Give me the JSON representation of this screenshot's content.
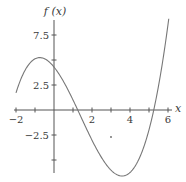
{
  "chart_data": {
    "type": "line",
    "title": "",
    "xlabel": "x",
    "ylabel": "f (x)",
    "xlim": [
      -2,
      6.2
    ],
    "ylim": [
      -6.5,
      8.5
    ],
    "grid": false,
    "x_ticks": [
      -2,
      -1,
      0,
      1,
      2,
      3,
      4,
      5,
      6
    ],
    "x_tick_labels": [
      {
        "value": -2,
        "label": "−2"
      },
      {
        "value": 2,
        "label": "2"
      },
      {
        "value": 4,
        "label": "4"
      },
      {
        "value": 6,
        "label": "6"
      }
    ],
    "y_ticks": [
      -5,
      -2.5,
      2.5,
      5,
      7.5
    ],
    "y_tick_labels": [
      {
        "value": 7.5,
        "label": "7.5"
      },
      {
        "value": 2.5,
        "label": "2.5"
      },
      {
        "value": -2.5,
        "label": "−2.5"
      }
    ],
    "series": [
      {
        "name": "f(x)",
        "description": "cubic curve with local max near x=-0.8 and local min near x=3.7",
        "x": [
          -2,
          -1.5,
          -1,
          -0.75,
          -0.5,
          0,
          0.5,
          1,
          1.25,
          1.5,
          2,
          2.5,
          3,
          3.5,
          3.7,
          4,
          4.5,
          5,
          5.25,
          5.5,
          6,
          6.2
        ],
        "y": [
          1.6,
          4.0,
          5.2,
          5.3,
          5.2,
          4.3,
          2.8,
          0.9,
          0.0,
          -0.9,
          -2.9,
          -4.6,
          -5.9,
          -6.5,
          -6.6,
          -6.4,
          -5.4,
          -2.7,
          0.0,
          2.0,
          8.6,
          11.0
        ]
      }
    ],
    "annotations": [
      {
        "type": "point",
        "x": 3,
        "y": -2.7
      }
    ],
    "x_intercepts": [
      1.25,
      5.25
    ],
    "local_max": {
      "x": -0.8,
      "y": 5.3
    },
    "local_min": {
      "x": 3.7,
      "y": -6.6
    }
  },
  "labels": {
    "y_axis": "f (x)",
    "x_axis": "x"
  }
}
